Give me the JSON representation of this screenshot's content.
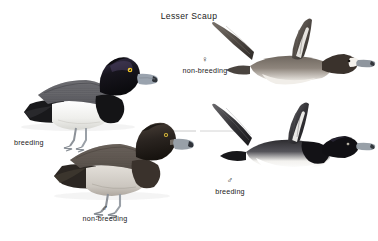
{
  "plate": {
    "title": "Lesser Scaup",
    "background_color": "#ffffff",
    "text_color": "#1b1b1b"
  },
  "symbols": {
    "male": "♂",
    "female": "♀"
  },
  "labels": {
    "breeding": "breeding",
    "non_breeding": "non-breeding"
  },
  "figures": [
    {
      "id": "swimming-breeding-male",
      "caption": "breeding",
      "sex_symbol": "",
      "pose": "swimming",
      "colors": {
        "head": "#13121a",
        "head_gloss": "#3b3350",
        "eye": "#f2c624",
        "bill": "#9aa3ae",
        "bill_nail": "#2c2f35",
        "back": "#6f6f72",
        "chest": "#161616",
        "flank": "#f2f2f0",
        "rear": "#1a1a1a",
        "feet": "#8d9299"
      }
    },
    {
      "id": "swimming-nonbreeding-male",
      "caption": "non-breeding",
      "sex_symbol": "♂",
      "pose": "swimming",
      "colors": {
        "head": "#2a2420",
        "eye": "#e6c killed",
        "bill": "#98a0a8",
        "back": "#6a625c",
        "chest": "#3a332e",
        "flank": "#cfcac3",
        "rear": "#2b2723",
        "feet": "#8d9299"
      }
    },
    {
      "id": "flying-nonbreeding-female",
      "caption": "non-breeding",
      "sex_symbol": "♀",
      "pose": "flying",
      "colors": {
        "head": "#3a322c",
        "face_blaze": "#f4f1ec",
        "bill": "#8f969e",
        "wing": "#4a443f",
        "wing_stripe": "#f3f1ed",
        "belly": "#efece7",
        "body": "#6b625a"
      }
    },
    {
      "id": "flying-breeding-male",
      "caption": "breeding",
      "sex_symbol": "♂",
      "pose": "flying",
      "colors": {
        "head": "#111014",
        "bill": "#98a0a8",
        "wing": "#2b2a2c",
        "wing_stripe": "#f5f4f1",
        "belly": "#ffffff",
        "chest": "#141316",
        "body": "#3a3a3c"
      }
    }
  ],
  "leader_lines": [
    {
      "id": "leader-nonbreeding-male-to-flying-male",
      "color": "#b9b9b9"
    }
  ]
}
